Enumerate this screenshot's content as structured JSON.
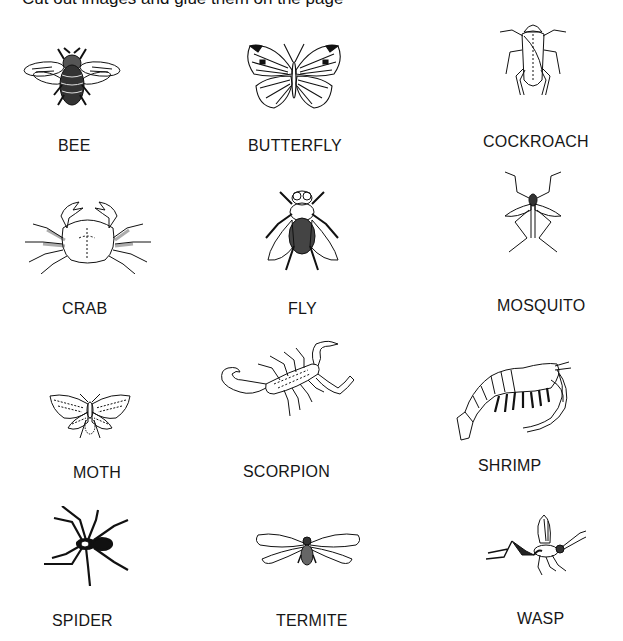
{
  "header": {
    "cut_off_text": "Cut out images and glue them on the page"
  },
  "items": [
    {
      "name": "BEE",
      "icon": "bee-icon"
    },
    {
      "name": "BUTTERFLY",
      "icon": "butterfly-icon"
    },
    {
      "name": "COCKROACH",
      "icon": "cockroach-icon"
    },
    {
      "name": "CRAB",
      "icon": "crab-icon"
    },
    {
      "name": "FLY",
      "icon": "fly-icon"
    },
    {
      "name": "MOSQUITO",
      "icon": "mosquito-icon"
    },
    {
      "name": "MOTH",
      "icon": "moth-icon"
    },
    {
      "name": "SCORPION",
      "icon": "scorpion-icon"
    },
    {
      "name": "SHRIMP",
      "icon": "shrimp-icon"
    },
    {
      "name": "SPIDER",
      "icon": "spider-icon"
    },
    {
      "name": "TERMITE",
      "icon": "termite-icon"
    },
    {
      "name": "WASP",
      "icon": "wasp-icon"
    }
  ],
  "colors": {
    "ink": "#111111",
    "background": "#ffffff"
  }
}
